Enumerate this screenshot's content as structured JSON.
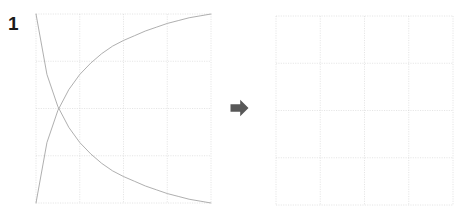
{
  "figure": {
    "panel_label": "1",
    "background_color": "#ffffff",
    "arrow_icon": "arrow-right-icon",
    "arrow_color": "#585858",
    "grid_color": "#cfcfcf",
    "curve_color": "#9a9a9a",
    "axis_color": "#b8b8b8"
  },
  "chart_data": [
    {
      "type": "line",
      "name": "source-chart",
      "title": "",
      "xlabel": "",
      "ylabel": "",
      "xlim": [
        0,
        1
      ],
      "ylim": [
        0,
        1
      ],
      "grid": true,
      "grid_divisions": 4,
      "grid_style": "dotted",
      "legend": "none",
      "x": [
        0,
        0.0625,
        0.125,
        0.1875,
        0.25,
        0.3125,
        0.375,
        0.4375,
        0.5,
        0.5625,
        0.625,
        0.6875,
        0.75,
        0.8125,
        0.875,
        0.9375,
        1
      ],
      "series": [
        {
          "name": "rising-curve",
          "color": "#9a9a9a",
          "values": [
            0,
            0.32,
            0.49,
            0.6,
            0.68,
            0.74,
            0.79,
            0.83,
            0.86,
            0.885,
            0.91,
            0.93,
            0.95,
            0.965,
            0.98,
            0.99,
            1.0
          ]
        },
        {
          "name": "falling-curve",
          "color": "#9a9a9a",
          "values": [
            1.0,
            0.68,
            0.51,
            0.4,
            0.32,
            0.26,
            0.21,
            0.17,
            0.14,
            0.115,
            0.09,
            0.07,
            0.05,
            0.035,
            0.02,
            0.01,
            0.0
          ]
        }
      ],
      "annotations": [
        {
          "name": "crossing-point",
          "x": 0.14,
          "y": 0.5
        }
      ]
    },
    {
      "type": "line",
      "name": "target-chart",
      "title": "",
      "xlabel": "",
      "ylabel": "",
      "xlim": [
        0,
        1
      ],
      "ylim": [
        0,
        1
      ],
      "grid": true,
      "grid_divisions": 4,
      "grid_style": "dotted",
      "legend": "none",
      "x": [],
      "series": []
    }
  ]
}
